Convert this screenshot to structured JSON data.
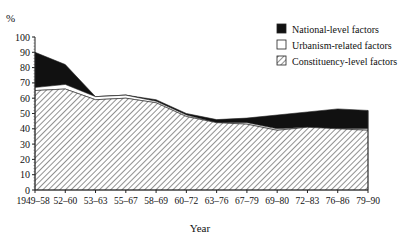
{
  "chart_data": {
    "type": "area",
    "stacked": true,
    "title": "",
    "ylabel": "%",
    "xlabel": "Year",
    "ylim": [
      0,
      100
    ],
    "yticks": [
      0,
      10,
      20,
      30,
      40,
      50,
      60,
      70,
      80,
      90,
      100
    ],
    "categories": [
      "1949–58",
      "52–60",
      "53–63",
      "55–67",
      "58–69",
      "60–72",
      "63–76",
      "67–79",
      "69–80",
      "72–83",
      "76–86",
      "79–90"
    ],
    "series": [
      {
        "name": "Constituency-level factors",
        "pattern": "hatched",
        "values": [
          65,
          66,
          59,
          60,
          57,
          48,
          44,
          43,
          39,
          41,
          40,
          39
        ]
      },
      {
        "name": "Urbanism-related factors",
        "pattern": "white",
        "values": [
          2,
          3,
          2,
          2,
          1,
          1,
          0,
          1,
          1,
          0,
          0,
          1
        ]
      },
      {
        "name": "National-level factors",
        "pattern": "black",
        "values": [
          23,
          13,
          0,
          0,
          1,
          1,
          2,
          3,
          9,
          10,
          13,
          12
        ]
      }
    ],
    "legend": {
      "position": "top-right",
      "entries": [
        "National-level factors",
        "Urbanism-related factors",
        "Constituency-level factors"
      ]
    },
    "grid": false
  }
}
